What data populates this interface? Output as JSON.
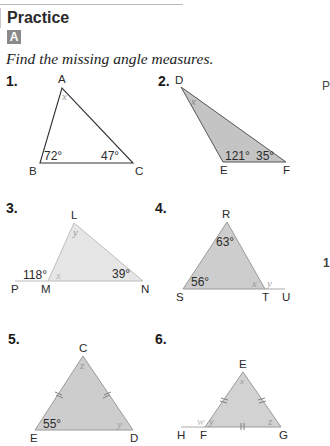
{
  "header": {
    "section_title": "Practice",
    "level_badge": "A",
    "instructions": "Find the missing angle measures."
  },
  "problems": [
    {
      "number": "1.",
      "vertices": {
        "A": "A",
        "B": "B",
        "C": "C"
      },
      "angles": {
        "A": "x",
        "B": "72°",
        "C": "47°"
      },
      "fill": "#ffffff"
    },
    {
      "number": "2.",
      "vertices": {
        "D": "D",
        "E": "E",
        "F": "F"
      },
      "angles": {
        "D": "x",
        "E": "121°",
        "F": "35°"
      },
      "fill": "#c4c4c4"
    },
    {
      "number": "3.",
      "vertices": {
        "L": "L",
        "M": "M",
        "N": "N",
        "P": "P"
      },
      "angles": {
        "L": "y",
        "PML": "118°",
        "M": "x",
        "N": "39°"
      },
      "fill": "#e6e6e6"
    },
    {
      "number": "4.",
      "vertices": {
        "R": "R",
        "S": "S",
        "T": "T",
        "U": "U"
      },
      "angles": {
        "R": "63°",
        "S": "56°",
        "T": "x",
        "RTU": "y"
      },
      "fill": "#cdcdcd"
    },
    {
      "number": "5.",
      "vertices": {
        "C": "C",
        "E": "E",
        "D": "D"
      },
      "angles": {
        "C": "z",
        "E": "55°",
        "D": "y"
      },
      "fill": "#cdcdcd"
    },
    {
      "number": "6.",
      "vertices": {
        "E": "E",
        "F": "F",
        "G": "G",
        "H": "H"
      },
      "angles": {
        "E": "x",
        "HFE": "w",
        "F": "y",
        "G": "z"
      },
      "fill": "#d2d2d2"
    }
  ],
  "clipped": {
    "right_letter": "P",
    "right_number": "1"
  }
}
